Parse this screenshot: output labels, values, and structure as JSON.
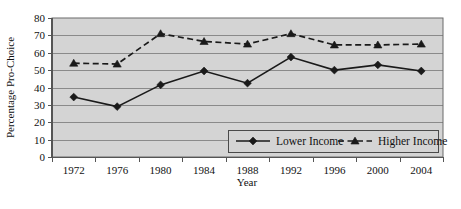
{
  "chart_data": {
    "type": "line",
    "title": "",
    "xlabel": "Year",
    "ylabel": "Percentage Pro-Choice",
    "categories": [
      "1972",
      "1976",
      "1980",
      "1984",
      "1988",
      "1992",
      "1996",
      "2000",
      "2004"
    ],
    "ylim": [
      0,
      80
    ],
    "ytick_step": 10,
    "yticks": [
      "0",
      "10",
      "20",
      "30",
      "40",
      "50",
      "60",
      "70",
      "80"
    ],
    "grid": true,
    "grid_axis": "y",
    "legend_position": "inside-bottom-right",
    "plot_background": "#d4d4d4",
    "series": [
      {
        "name": "Lower Income",
        "marker": "diamond",
        "linestyle": "solid",
        "color": "#1a1a1a",
        "values": [
          34.5,
          29,
          41.5,
          49.5,
          42.5,
          57.5,
          50,
          53,
          49.5
        ]
      },
      {
        "name": "Higher Income",
        "marker": "triangle",
        "linestyle": "dashed",
        "color": "#1a1a1a",
        "values": [
          54,
          53.5,
          71,
          66.5,
          65,
          71,
          64.5,
          64.5,
          65
        ]
      }
    ]
  },
  "legend": {
    "items": [
      {
        "label": "Lower Income"
      },
      {
        "label": "Higher Income"
      }
    ]
  }
}
